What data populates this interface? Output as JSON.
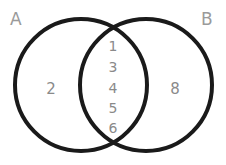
{
  "diagram": {
    "type": "venn",
    "sets": [
      {
        "name": "A",
        "label": "A",
        "only": [
          "2"
        ]
      },
      {
        "name": "B",
        "label": "B",
        "only": [
          "8"
        ]
      }
    ],
    "intersection": [
      "1",
      "3",
      "4",
      "5",
      "6"
    ],
    "colors": {
      "circle_stroke": "#1a1a1a",
      "label_text": "#9a9a9a",
      "number_text": "#8a8a8a"
    }
  }
}
